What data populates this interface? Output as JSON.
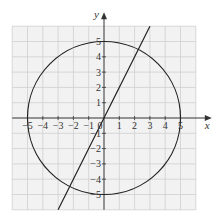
{
  "chart_data": {
    "type": "line",
    "title": "",
    "xlabel": "x",
    "ylabel": "y",
    "xlim": [
      -6,
      6
    ],
    "ylim": [
      -6,
      6
    ],
    "grid": true,
    "x_ticks": [
      -5,
      -4,
      -3,
      -2,
      -1,
      0,
      1,
      2,
      3,
      4,
      5
    ],
    "y_ticks": [
      -5,
      -4,
      -3,
      -2,
      -1,
      1,
      2,
      3,
      4,
      5
    ],
    "x_tick_labels": [
      "−5",
      "−4",
      "−3",
      "−2",
      "−1",
      "0",
      "1",
      "2",
      "3",
      "4",
      "5"
    ],
    "y_tick_labels": [
      "−5",
      "−4",
      "−3",
      "−2",
      "−1",
      "1",
      "2",
      "3",
      "4",
      "5"
    ],
    "series": [
      {
        "name": "circle",
        "equation": "x^2 + y^2 = 25",
        "kind": "circle",
        "center": [
          0,
          0
        ],
        "radius": 5
      },
      {
        "name": "line",
        "equation": "y = 2x",
        "kind": "line",
        "x": [
          -3,
          3
        ],
        "y": [
          -6,
          6
        ]
      }
    ]
  },
  "colors": {
    "grid_fill": "#f2f2f2",
    "grid_line": "#cfcfcf",
    "axis": "#333333",
    "curve": "#222222"
  },
  "labels": {
    "x_axis": "x",
    "y_axis": "y",
    "origin": "0"
  }
}
